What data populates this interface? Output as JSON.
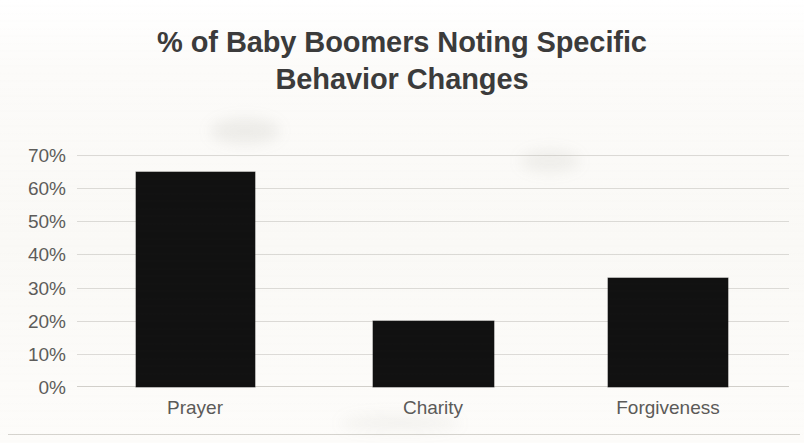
{
  "chart_data": {
    "type": "bar",
    "title": "% of Baby Boomers Noting Specific Behavior Changes",
    "title_lines": [
      "% of Baby Boomers Noting Specific",
      "Behavior Changes"
    ],
    "categories": [
      "Prayer",
      "Charity",
      "Forgiveness"
    ],
    "values": [
      65,
      20,
      33
    ],
    "value_labels": [
      "65%",
      "20%",
      "33%"
    ],
    "xlabel": "",
    "ylabel": "",
    "ylim": [
      0,
      70
    ],
    "ytick_values": [
      70,
      60,
      50,
      40,
      30,
      20,
      10,
      0
    ],
    "ytick_labels": [
      "70%",
      "60%",
      "50%",
      "40%",
      "30%",
      "20%",
      "10%",
      "0%"
    ],
    "grid": true,
    "legend": false,
    "bar_color": "#111111",
    "text_color": "#3b3b3b",
    "axis_text_color": "#5d5c5a",
    "gridline_color": "#96928a",
    "background_color": "#fbfaf8"
  }
}
